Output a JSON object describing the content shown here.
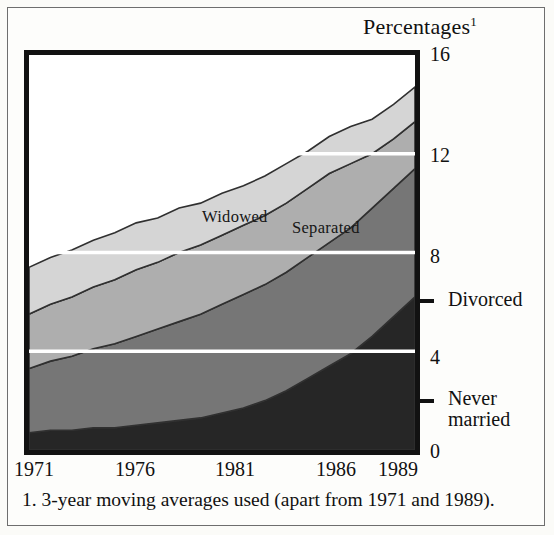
{
  "figure": {
    "axis_title": "Percentages",
    "axis_title_superscript": "1",
    "footnote": "1. 3-year moving averages used (apart from 1971 and 1989)."
  },
  "right_labels": {
    "divorced": "Divorced",
    "never_married_line1": "Never",
    "never_married_line2": "married"
  },
  "band_labels": {
    "widowed": "Widowed",
    "separated": "Separated"
  },
  "colors": {
    "never_married": "#262626",
    "divorced": "#767676",
    "separated": "#aeaeae",
    "widowed": "#d5d5d5",
    "gridline": "#ffffff",
    "band_outline": "#303030",
    "frame": "#121212"
  },
  "chart_data": {
    "type": "area",
    "stacked": true,
    "title": "Percentages",
    "xlabel": "",
    "ylabel": "Percentages",
    "xlim": [
      1971,
      1989
    ],
    "ylim": [
      0,
      16
    ],
    "yticks": [
      0,
      4,
      8,
      12,
      16
    ],
    "ytick_labels": [
      "0",
      "4",
      "8",
      "12",
      "16"
    ],
    "xticks": [
      1971,
      1976,
      1981,
      1986,
      1989
    ],
    "xtick_labels": [
      "1971",
      "1976",
      "1981",
      "1986",
      "1989"
    ],
    "gridlines": [
      4,
      8,
      12
    ],
    "grid": true,
    "legend_position": "inline-band-labels-and-right-margin",
    "x": [
      1971,
      1972,
      1973,
      1974,
      1975,
      1976,
      1977,
      1978,
      1979,
      1980,
      1981,
      1982,
      1983,
      1984,
      1985,
      1986,
      1987,
      1988,
      1989
    ],
    "series": [
      {
        "name": "Never married",
        "color": "#262626",
        "label_position": "right-margin",
        "values": [
          0.7,
          0.8,
          0.8,
          0.9,
          0.9,
          1.0,
          1.1,
          1.2,
          1.3,
          1.5,
          1.7,
          2.0,
          2.4,
          2.9,
          3.4,
          3.9,
          4.6,
          5.4,
          6.2
        ]
      },
      {
        "name": "Divorced",
        "color": "#767676",
        "label_position": "right-margin",
        "values": [
          2.6,
          2.8,
          3.0,
          3.2,
          3.4,
          3.6,
          3.8,
          4.0,
          4.2,
          4.4,
          4.6,
          4.7,
          4.8,
          4.9,
          5.0,
          5.1,
          5.2,
          5.2,
          5.2
        ]
      },
      {
        "name": "Separated",
        "color": "#aeaeae",
        "label_position": "inline",
        "values": [
          2.2,
          2.3,
          2.4,
          2.5,
          2.6,
          2.7,
          2.7,
          2.8,
          2.8,
          2.8,
          2.8,
          2.8,
          2.8,
          2.8,
          2.8,
          2.6,
          2.2,
          2.0,
          1.9
        ]
      },
      {
        "name": "Widowed",
        "color": "#d5d5d5",
        "label_position": "inline",
        "values": [
          1.9,
          1.9,
          1.9,
          1.9,
          1.9,
          1.9,
          1.8,
          1.8,
          1.7,
          1.7,
          1.6,
          1.6,
          1.6,
          1.5,
          1.5,
          1.5,
          1.4,
          1.4,
          1.4
        ]
      }
    ],
    "totals": [
      7.4,
      7.8,
      8.1,
      8.5,
      8.8,
      9.2,
      9.4,
      9.8,
      10.0,
      10.4,
      10.7,
      11.1,
      11.6,
      12.1,
      12.7,
      13.1,
      13.4,
      14.0,
      14.7
    ]
  }
}
